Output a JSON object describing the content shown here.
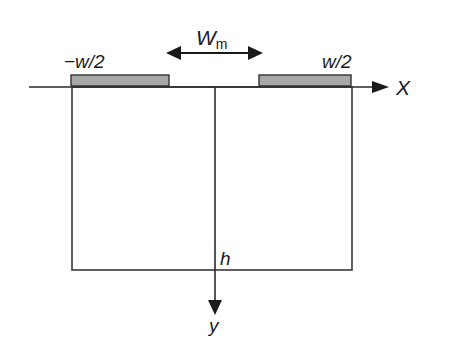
{
  "diagram": {
    "labels": {
      "left_electrode": "−w/2",
      "right_electrode": "w/2",
      "gap_main": "W",
      "gap_sub": "m",
      "x_axis": "X",
      "y_axis": "y",
      "height": "h"
    },
    "colors": {
      "line": "#2a2a2a",
      "electrode_fill": "#a8a8a8",
      "electrode_stroke": "#333333",
      "background": "#ffffff"
    }
  }
}
